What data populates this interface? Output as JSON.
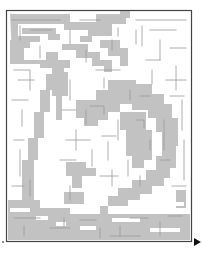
{
  "puzzle": {
    "type": "maze",
    "hidden_picture": "gray-shaded corridors forming a large rounded fruit/shell shape with a leaf and stem at top",
    "colors": {
      "background": "#ffffff",
      "shade": "#c2c2c2",
      "wall": "#9a9a9a",
      "border": "#444444",
      "arrow": "#111111"
    },
    "entrance": {
      "position": "bottom-left",
      "marker": "small dot"
    },
    "exit": {
      "position": "bottom-right",
      "marker": "right-pointing arrow"
    }
  }
}
